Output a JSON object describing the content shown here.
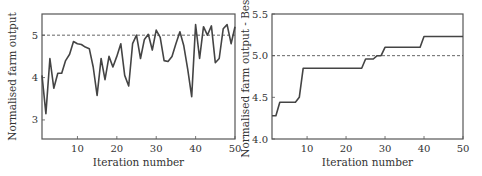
{
  "chart_data": [
    {
      "type": "line",
      "title": "",
      "xlabel": "Iteration number",
      "ylabel": "Normalised farm output",
      "xlim": [
        1,
        50
      ],
      "ylim": [
        2.55,
        5.5
      ],
      "xticks": [
        10,
        20,
        30,
        40,
        50
      ],
      "yticks": [
        3,
        4,
        5
      ],
      "grid": false,
      "reference_line": {
        "y": 5,
        "style": "dashed"
      },
      "series": [
        {
          "name": "Normalised farm output",
          "x": [
            1,
            2,
            3,
            4,
            5,
            6,
            7,
            8,
            9,
            10,
            11,
            12,
            13,
            14,
            15,
            16,
            17,
            18,
            19,
            20,
            21,
            22,
            23,
            24,
            25,
            26,
            27,
            28,
            29,
            30,
            31,
            32,
            33,
            34,
            35,
            36,
            37,
            38,
            39,
            40,
            41,
            42,
            43,
            44,
            45,
            46,
            47,
            48,
            49,
            50
          ],
          "values": [
            4.05,
            3.15,
            4.45,
            3.75,
            4.1,
            4.1,
            4.4,
            4.55,
            4.85,
            4.8,
            4.78,
            4.72,
            4.68,
            4.25,
            3.58,
            4.45,
            3.95,
            4.5,
            4.25,
            4.5,
            4.8,
            4.05,
            3.8,
            4.8,
            5.0,
            4.45,
            4.9,
            5.02,
            4.65,
            5.12,
            4.95,
            4.4,
            4.38,
            4.5,
            4.8,
            5.08,
            4.75,
            4.2,
            3.55,
            5.25,
            4.45,
            5.2,
            5.0,
            5.22,
            4.35,
            4.45,
            5.15,
            5.25,
            4.8,
            5.2
          ]
        }
      ]
    },
    {
      "type": "line",
      "title": "",
      "xlabel": "Iteration number",
      "ylabel": "Normalised farm output - Best",
      "xlim": [
        1,
        50
      ],
      "ylim": [
        4.0,
        5.5
      ],
      "xticks": [
        10,
        20,
        30,
        40,
        50
      ],
      "yticks": [
        4.0,
        4.5,
        5.0,
        5.5
      ],
      "grid": false,
      "reference_line": {
        "y": 5.0,
        "style": "dashed"
      },
      "series": [
        {
          "name": "Best so far",
          "x": [
            1,
            2,
            3,
            4,
            5,
            6,
            7,
            8,
            9,
            10,
            11,
            12,
            13,
            14,
            15,
            16,
            17,
            18,
            19,
            20,
            21,
            22,
            23,
            24,
            25,
            26,
            27,
            28,
            29,
            30,
            31,
            32,
            33,
            34,
            35,
            36,
            37,
            38,
            39,
            40,
            41,
            42,
            43,
            44,
            45,
            46,
            47,
            48,
            49,
            50
          ],
          "values": [
            4.28,
            4.28,
            4.44,
            4.44,
            4.44,
            4.44,
            4.44,
            4.5,
            4.85,
            4.85,
            4.85,
            4.85,
            4.85,
            4.85,
            4.85,
            4.85,
            4.85,
            4.85,
            4.85,
            4.85,
            4.85,
            4.85,
            4.85,
            4.85,
            4.96,
            4.96,
            4.96,
            5.0,
            5.0,
            5.1,
            5.1,
            5.1,
            5.1,
            5.1,
            5.1,
            5.1,
            5.1,
            5.1,
            5.1,
            5.23,
            5.23,
            5.23,
            5.23,
            5.23,
            5.23,
            5.23,
            5.23,
            5.23,
            5.23,
            5.23
          ]
        }
      ]
    }
  ],
  "colors": {
    "line": "#444444",
    "axis": "#555555",
    "dashed": "#555555",
    "text": "#333333"
  }
}
